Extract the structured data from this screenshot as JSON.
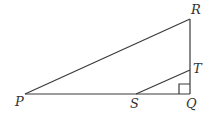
{
  "diagram": {
    "type": "geometry",
    "points": {
      "P": {
        "label": "P",
        "x": 25,
        "y": 94
      },
      "Q": {
        "label": "Q",
        "x": 190,
        "y": 94
      },
      "R": {
        "label": "R",
        "x": 190,
        "y": 19
      },
      "S": {
        "label": "S",
        "x": 136,
        "y": 94
      },
      "T": {
        "label": "T",
        "x": 190,
        "y": 70
      }
    },
    "segments": [
      [
        "P",
        "R"
      ],
      [
        "R",
        "Q"
      ],
      [
        "P",
        "Q"
      ],
      [
        "S",
        "T"
      ]
    ],
    "right_angle_at": "Q",
    "colors": {
      "stroke": "#3a3a3a",
      "label": "#333333",
      "background": "#ffffff"
    }
  }
}
